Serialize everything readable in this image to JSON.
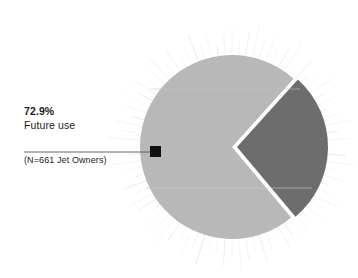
{
  "chart_data": {
    "type": "pie",
    "title": "",
    "subtitle": "",
    "xlabel": "",
    "ylabel": "",
    "legend_position": "none",
    "grid": false,
    "sample_note": "(N=661 Jet Owners)",
    "categories": [
      "Future use",
      "Other"
    ],
    "values": [
      72.9,
      27.1
    ],
    "slices": [
      {
        "label": "Future use",
        "value": 72.9,
        "value_text": "72.9%",
        "color": "#b8b8b8",
        "start_angle_deg": 48,
        "end_angle_deg": 310,
        "annotated": true,
        "exploded": false
      },
      {
        "label": "Other",
        "value": 27.1,
        "value_text": "",
        "color": "#6d6d6d",
        "start_angle_deg": -50,
        "end_angle_deg": 48,
        "annotated": false,
        "exploded": true
      }
    ],
    "annotation": {
      "percent": "72.9%",
      "label": "Future use",
      "sample": "(N=661 Jet Owners)",
      "marker_color": "#111111",
      "leader_color": "#555555"
    },
    "decoration": {
      "sunburst_rays": 84,
      "ray_color": "#c9c9c9"
    },
    "colors": {
      "background": "#ffffff",
      "slice_major": "#b8b8b8",
      "slice_minor": "#6d6d6d",
      "text": "#1c1c1c",
      "gap": "#ffffff"
    }
  },
  "callout": {
    "percent": "72.9%",
    "label": "Future use",
    "sample": "(N=661 Jet Owners)"
  }
}
